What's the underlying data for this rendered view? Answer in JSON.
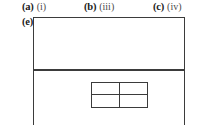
{
  "figure": {
    "background_color": "#ffffff",
    "line_color": "#3b3b3b",
    "text_color": "#231f20"
  },
  "answers": {
    "items": [
      {
        "key": "(a)",
        "value": "(i)"
      },
      {
        "key": "(b)",
        "value": "(iii)"
      },
      {
        "key": "(c)",
        "value": "(iv)"
      }
    ],
    "continued": {
      "key": "(e)",
      "value": ""
    }
  },
  "diagram": {
    "outer_rectangle": {
      "label": "",
      "divider_present": true
    },
    "inner_grid": {
      "rows": 2,
      "columns": 2,
      "cells": [
        "",
        "",
        "",
        ""
      ]
    }
  }
}
